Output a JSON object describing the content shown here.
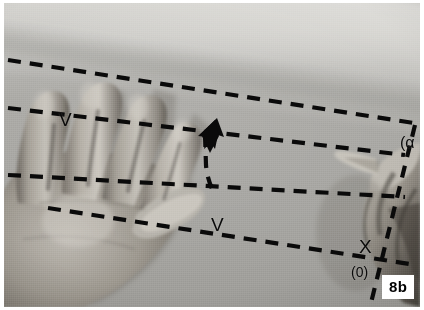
{
  "figure": {
    "label": "8b",
    "domain": "photograph-with-annotations"
  },
  "annotations": {
    "velocity_label_upper": "V",
    "velocity_label_lower": "V",
    "intersection_label": "X",
    "origin_label": "(0)",
    "angle_label": "(α",
    "arrow_name": "direction-arrow"
  },
  "colors": {
    "annotation": "#0a0a0a",
    "label_background": "#ffffff",
    "label_text": "#000000",
    "photo_border": "#ffffff",
    "background_light": "#c9c8c4",
    "background_mid": "#a9a8a4",
    "background_dark": "#9e9d99",
    "skin_light": "#b8b4ad",
    "skin_mid": "#96918a",
    "skin_dark": "#5f5b55"
  },
  "guide_lines": [
    {
      "name": "guide-line-1",
      "x1": 4,
      "y1": 57,
      "x2": 416,
      "y2": 121
    },
    {
      "name": "guide-line-2",
      "x1": 4,
      "y1": 105,
      "x2": 399,
      "y2": 152
    },
    {
      "name": "guide-line-3",
      "x1": 4,
      "y1": 172,
      "x2": 399,
      "y2": 195
    },
    {
      "name": "guide-line-4",
      "x1": 44,
      "y1": 205,
      "x2": 410,
      "y2": 262
    },
    {
      "name": "guide-line-vertical",
      "x1": 409,
      "y1": 124,
      "x2": 368,
      "y2": 304
    },
    {
      "name": "guide-line-arrow-tail",
      "x1": 203,
      "y1": 130,
      "x2": 209,
      "y2": 190
    }
  ]
}
